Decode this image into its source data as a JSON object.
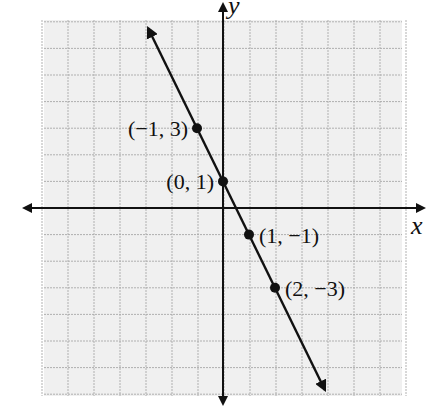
{
  "chart_data": {
    "type": "line",
    "title": "",
    "xlabel": "x",
    "ylabel": "y",
    "xlim": [
      -7,
      7
    ],
    "ylim": [
      -7,
      7
    ],
    "grid": true,
    "equation": "y = -2x + 1",
    "line": {
      "slope": -2,
      "intercept": 1,
      "arrows_both_ends": true
    },
    "points": [
      {
        "x": -1,
        "y": 3,
        "label": "(−1, 3)",
        "label_side": "left"
      },
      {
        "x": 0,
        "y": 1,
        "label": "(0, 1)",
        "label_side": "left"
      },
      {
        "x": 1,
        "y": -1,
        "label": "(1, −1)",
        "label_side": "right"
      },
      {
        "x": 2,
        "y": -3,
        "label": "(2, −3)",
        "label_side": "right"
      }
    ],
    "colors": {
      "grid_bg": "#f0f0f0",
      "grid_line": "#a8a8a8",
      "ink": "#111111"
    }
  },
  "axes": {
    "x_label": "x",
    "y_label": "y"
  }
}
